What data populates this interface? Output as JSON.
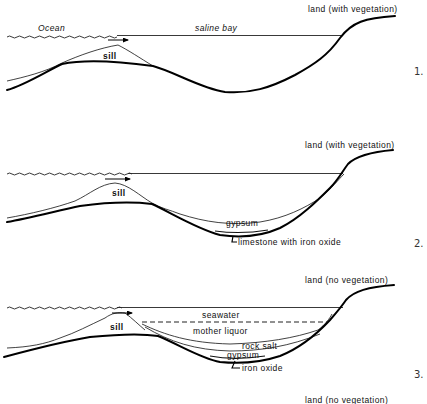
{
  "figure": {
    "panels": [
      {
        "number": "1.",
        "labels": {
          "ocean": "Ocean",
          "bay": "saline bay",
          "sill": "sill",
          "land": "land (with vegetation)"
        }
      },
      {
        "number": "2.",
        "labels": {
          "sill": "sill",
          "land": "land (with vegetation)",
          "gypsum": "gypsum",
          "limestone": "limestone with iron oxide"
        }
      },
      {
        "number": "3.",
        "labels": {
          "sill": "sill",
          "land": "land (no vegetation)",
          "seawater": "seawater",
          "mother_liquor": "mother liquor",
          "rock_salt": "rock salt",
          "gypsum": "gypsum",
          "iron_oxide": "iron oxide"
        }
      },
      {
        "number": "",
        "labels": {
          "land": "land (no vegetation)"
        }
      }
    ],
    "colors": {
      "line": "#000000",
      "background": "#ffffff",
      "text": "#111111"
    }
  }
}
